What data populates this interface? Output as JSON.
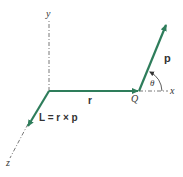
{
  "diagram": {
    "title": "",
    "colors": {
      "vector": "#2e7d5b",
      "axis": "#555555",
      "text": "#333333"
    },
    "axes": {
      "y_label": "y",
      "x_label": "x",
      "z_label": "z"
    },
    "vectors": {
      "r_label": "r",
      "p_label": "p",
      "L_label": "L = r × p"
    },
    "points": {
      "Q_label": "Q"
    },
    "angles": {
      "theta_label": "θ"
    }
  }
}
